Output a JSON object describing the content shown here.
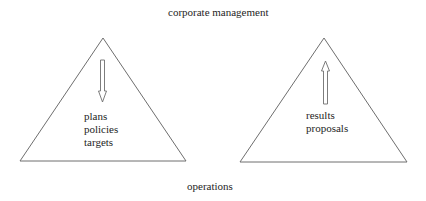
{
  "title_top": "corporate management",
  "title_bottom": "operations",
  "left_triangle": {
    "arrow_direction": "down",
    "items": [
      "plans",
      "policies",
      "targets"
    ]
  },
  "right_triangle": {
    "arrow_direction": "up",
    "items": [
      "results",
      "proposals"
    ]
  },
  "colors": {
    "line": "#6e6e6e",
    "text": "#1e1e1e",
    "background": "#ffffff"
  }
}
